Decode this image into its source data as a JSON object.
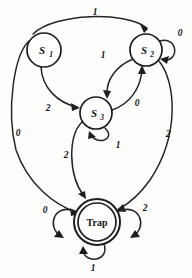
{
  "diagram": {
    "type": "state-transition-diagram",
    "title": "",
    "alphabet": [
      "0",
      "1",
      "2"
    ],
    "states": [
      {
        "id": "S1",
        "label": "S",
        "sublabel": "1",
        "accepting": false,
        "cx": 44,
        "cy": 50,
        "r": 17
      },
      {
        "id": "S2",
        "label": "S",
        "sublabel": "2",
        "accepting": false,
        "cx": 146,
        "cy": 50,
        "r": 16
      },
      {
        "id": "S3",
        "label": "S",
        "sublabel": "3",
        "accepting": false,
        "cx": 96,
        "cy": 113,
        "r": 16
      },
      {
        "id": "Trap",
        "label": "Trap",
        "sublabel": "",
        "accepting": true,
        "cx": 97,
        "cy": 222,
        "r": 23
      }
    ],
    "transitions": [
      {
        "from": "S1",
        "to": "S2",
        "label": "1",
        "label_x": 95,
        "label_y": 12,
        "kind": "arc-top"
      },
      {
        "from": "S1",
        "to": "S3",
        "label": "2",
        "label_x": 48,
        "label_y": 108,
        "kind": "arc"
      },
      {
        "from": "S1",
        "to": "Trap",
        "label": "0",
        "label_x": 18,
        "label_y": 133,
        "kind": "arc-left"
      },
      {
        "from": "S2",
        "to": "S2",
        "label": "0",
        "label_x": 180,
        "label_y": 33,
        "kind": "self-loop-right"
      },
      {
        "from": "S2",
        "to": "S3",
        "label": "1",
        "label_x": 103,
        "label_y": 55,
        "kind": "arc"
      },
      {
        "from": "S3",
        "to": "S2",
        "label": "0",
        "label_x": 137,
        "label_y": 103,
        "kind": "arc"
      },
      {
        "from": "S2",
        "to": "Trap",
        "label": "2",
        "label_x": 168,
        "label_y": 134,
        "kind": "arc-right"
      },
      {
        "from": "S3",
        "to": "S3",
        "label": "1",
        "label_x": 118,
        "label_y": 145,
        "kind": "self-loop-bottom"
      },
      {
        "from": "S3",
        "to": "Trap",
        "label": "2",
        "label_x": 66,
        "label_y": 155,
        "kind": "arc"
      },
      {
        "from": "Trap",
        "to": "Trap",
        "label": "0",
        "label_x": 45,
        "label_y": 210,
        "kind": "self-loop-left"
      },
      {
        "from": "Trap",
        "to": "Trap",
        "label": "2",
        "label_x": 145,
        "label_y": 208,
        "kind": "self-loop-right"
      },
      {
        "from": "Trap",
        "to": "Trap",
        "label": "1",
        "label_x": 93,
        "label_y": 268,
        "kind": "self-loop-bottom"
      }
    ],
    "colors": {
      "stroke": "#1d1d1d",
      "background": "#fdfdfc",
      "text": "#141414"
    }
  }
}
